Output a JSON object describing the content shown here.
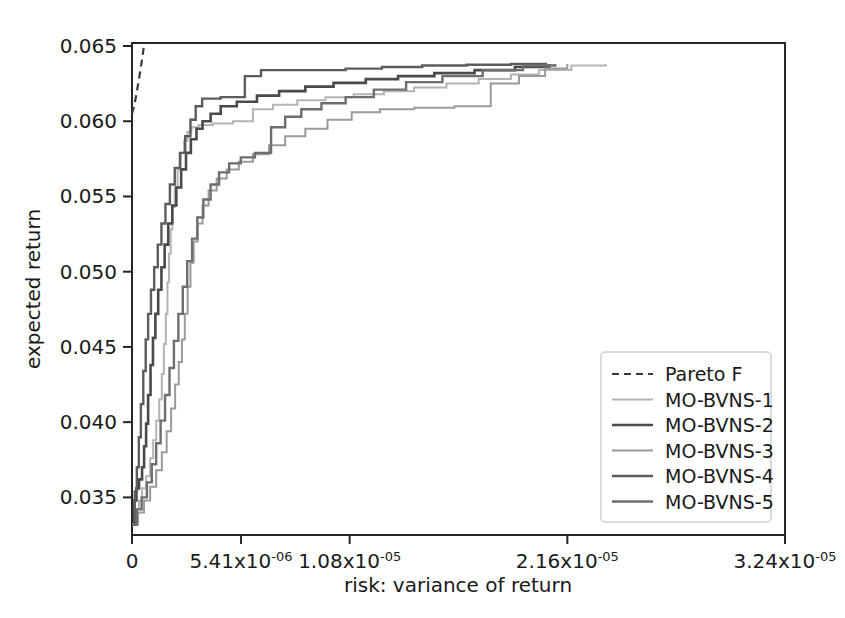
{
  "chart_data": {
    "type": "line",
    "title": "",
    "xlabel": "risk: variance of return",
    "ylabel": "expected return",
    "grid": false,
    "legend_position": "lower-right",
    "xlim": [
      0,
      3.24e-05
    ],
    "ylim": [
      0.0325,
      0.0652
    ],
    "xticks": [
      0,
      5.41e-06,
      1.08e-05,
      2.16e-05,
      3.24e-05
    ],
    "xtick_labels": [
      {
        "mantissa": "0",
        "exp": ""
      },
      {
        "mantissa": "5.41x10",
        "exp": "-06"
      },
      {
        "mantissa": "1.08x10",
        "exp": "-05"
      },
      {
        "mantissa": "2.16x10",
        "exp": "-05"
      },
      {
        "mantissa": "3.24x10",
        "exp": "-05"
      }
    ],
    "yticks": [
      0.035,
      0.04,
      0.045,
      0.05,
      0.055,
      0.06,
      0.065
    ],
    "ytick_labels": [
      "0.035",
      "0.040",
      "0.045",
      "0.050",
      "0.055",
      "0.060",
      "0.065"
    ],
    "series": [
      {
        "name": "Pareto F",
        "color": "#3a3a3a",
        "width": 2.2,
        "dash": "7,5",
        "points": [
          [
            0.0,
            0.0605
          ],
          [
            1.2e-07,
            0.0611
          ],
          [
            2.2e-07,
            0.0618
          ],
          [
            3.2e-07,
            0.0626
          ],
          [
            4.2e-07,
            0.0634
          ],
          [
            5.2e-07,
            0.0643
          ],
          [
            6e-07,
            0.0651
          ]
        ]
      },
      {
        "name": "MO-BVNS-1",
        "color": "#b4b4b4",
        "width": 2.0,
        "dash": "",
        "points": [
          [
            0.0,
            0.0332
          ],
          [
            2e-07,
            0.0342
          ],
          [
            3.5e-07,
            0.0348
          ],
          [
            5e-07,
            0.0356
          ],
          [
            7e-07,
            0.0364
          ],
          [
            9e-07,
            0.0376
          ],
          [
            1.05e-06,
            0.0388
          ],
          [
            1.2e-06,
            0.0401
          ],
          [
            1.35e-06,
            0.0415
          ],
          [
            1.48e-06,
            0.0432
          ],
          [
            1.58e-06,
            0.0452
          ],
          [
            1.68e-06,
            0.0472
          ],
          [
            1.76e-06,
            0.0493
          ],
          [
            1.84e-06,
            0.0512
          ],
          [
            1.92e-06,
            0.0528
          ],
          [
            2e-06,
            0.0543
          ],
          [
            2.12e-06,
            0.0556
          ],
          [
            2.26e-06,
            0.0568
          ],
          [
            2.42e-06,
            0.0579
          ],
          [
            2.58e-06,
            0.0587
          ],
          [
            2.75e-06,
            0.0593
          ],
          [
            2.95e-06,
            0.0596
          ],
          [
            3.3e-06,
            0.05975
          ],
          [
            4e-06,
            0.05985
          ],
          [
            5e-06,
            0.06
          ],
          [
            6e-06,
            0.0608
          ],
          [
            7e-06,
            0.0611
          ],
          [
            8.2e-06,
            0.0614
          ],
          [
            9.6e-06,
            0.0616
          ],
          [
            1.1e-05,
            0.0618
          ],
          [
            1.25e-05,
            0.062
          ],
          [
            1.4e-05,
            0.06225
          ],
          [
            1.56e-05,
            0.0625
          ],
          [
            1.72e-05,
            0.0628
          ],
          [
            1.88e-05,
            0.0631
          ],
          [
            2.02e-05,
            0.0634
          ],
          [
            2.18e-05,
            0.0637
          ],
          [
            2.35e-05,
            0.0638
          ]
        ]
      },
      {
        "name": "MO-BVNS-2",
        "color": "#4a4a4a",
        "width": 2.6,
        "dash": "",
        "points": [
          [
            0.0,
            0.0332
          ],
          [
            1.2e-07,
            0.0348
          ],
          [
            2.2e-07,
            0.0356
          ],
          [
            3.5e-07,
            0.0362
          ],
          [
            5e-07,
            0.037
          ],
          [
            6e-07,
            0.0384
          ],
          [
            7e-07,
            0.0399
          ],
          [
            8e-07,
            0.0418
          ],
          [
            9.2e-07,
            0.0438
          ],
          [
            1.04e-06,
            0.0456
          ],
          [
            1.16e-06,
            0.0472
          ],
          [
            1.3e-06,
            0.0488
          ],
          [
            1.46e-06,
            0.0503
          ],
          [
            1.62e-06,
            0.0518
          ],
          [
            1.8e-06,
            0.0532
          ],
          [
            2e-06,
            0.0544
          ],
          [
            2.2e-06,
            0.0556
          ],
          [
            2.44e-06,
            0.0568
          ],
          [
            2.68e-06,
            0.0579
          ],
          [
            2.92e-06,
            0.0588
          ],
          [
            3.2e-06,
            0.0595
          ],
          [
            3.5e-06,
            0.06
          ],
          [
            3.9e-06,
            0.0605
          ],
          [
            4.4e-06,
            0.061
          ],
          [
            5.2e-06,
            0.0613
          ],
          [
            6.2e-06,
            0.0617
          ],
          [
            7.3e-06,
            0.062
          ],
          [
            8.6e-06,
            0.0623
          ],
          [
            1e-05,
            0.06255
          ],
          [
            1.16e-05,
            0.0628
          ],
          [
            1.32e-05,
            0.063
          ],
          [
            1.5e-05,
            0.0632
          ],
          [
            1.7e-05,
            0.0634
          ],
          [
            1.9e-05,
            0.0636
          ],
          [
            2.07e-05,
            0.0638
          ]
        ]
      },
      {
        "name": "MO-BVNS-3",
        "color": "#9a9a9a",
        "width": 2.0,
        "dash": "",
        "points": [
          [
            0.0,
            0.0332
          ],
          [
            3e-07,
            0.034
          ],
          [
            6e-07,
            0.0348
          ],
          [
            9e-07,
            0.0357
          ],
          [
            1.2e-06,
            0.0368
          ],
          [
            1.48e-06,
            0.038
          ],
          [
            1.72e-06,
            0.0394
          ],
          [
            1.94e-06,
            0.0409
          ],
          [
            2.14e-06,
            0.0425
          ],
          [
            2.32e-06,
            0.044
          ],
          [
            2.48e-06,
            0.0455
          ],
          [
            2.62e-06,
            0.0472
          ],
          [
            2.76e-06,
            0.049
          ],
          [
            2.9e-06,
            0.0506
          ],
          [
            3.06e-06,
            0.052
          ],
          [
            3.26e-06,
            0.0532
          ],
          [
            3.5e-06,
            0.0544
          ],
          [
            3.8e-06,
            0.0554
          ],
          [
            4.2e-06,
            0.0562
          ],
          [
            4.7e-06,
            0.0568
          ],
          [
            5.3e-06,
            0.0573
          ],
          [
            6e-06,
            0.0578
          ],
          [
            6.8e-06,
            0.0584
          ],
          [
            7.6e-06,
            0.059
          ],
          [
            8.6e-06,
            0.0595
          ],
          [
            9.7e-06,
            0.0601
          ],
          [
            1.09e-05,
            0.0606
          ],
          [
            1.23e-05,
            0.0608
          ],
          [
            1.4e-05,
            0.0609
          ],
          [
            1.6e-05,
            0.061
          ],
          [
            1.78e-05,
            0.0625
          ],
          [
            1.92e-05,
            0.063
          ],
          [
            2.05e-05,
            0.0635
          ],
          [
            2.16e-05,
            0.0638
          ]
        ]
      },
      {
        "name": "MO-BVNS-4",
        "color": "#5c5c5c",
        "width": 2.4,
        "dash": "",
        "points": [
          [
            0.0,
            0.0332
          ],
          [
            1.4e-07,
            0.0354
          ],
          [
            2.4e-07,
            0.037
          ],
          [
            3.4e-07,
            0.039
          ],
          [
            4.4e-07,
            0.0412
          ],
          [
            5.6e-07,
            0.0434
          ],
          [
            6.8e-07,
            0.0455
          ],
          [
            8e-07,
            0.0472
          ],
          [
            9.4e-07,
            0.0488
          ],
          [
            1.1e-06,
            0.0503
          ],
          [
            1.28e-06,
            0.0518
          ],
          [
            1.46e-06,
            0.0532
          ],
          [
            1.66e-06,
            0.0545
          ],
          [
            1.88e-06,
            0.0558
          ],
          [
            2.12e-06,
            0.0569
          ],
          [
            2.38e-06,
            0.0579
          ],
          [
            2.64e-06,
            0.059
          ],
          [
            2.9e-06,
            0.0601
          ],
          [
            3.16e-06,
            0.061
          ],
          [
            3.48e-06,
            0.0615
          ],
          [
            3.9e-06,
            0.0615
          ],
          [
            4.4e-06,
            0.0616
          ],
          [
            5.2e-06,
            0.0616
          ],
          [
            5.6e-06,
            0.063
          ],
          [
            6.4e-06,
            0.0634
          ],
          [
            7.6e-06,
            0.0634
          ],
          [
            9e-06,
            0.0634
          ],
          [
            1.06e-05,
            0.0635
          ],
          [
            1.24e-05,
            0.0636
          ],
          [
            1.44e-05,
            0.0637
          ],
          [
            1.66e-05,
            0.06375
          ],
          [
            1.88e-05,
            0.0638
          ],
          [
            2.06e-05,
            0.0638
          ]
        ]
      },
      {
        "name": "MO-BVNS-5",
        "color": "#6e6e6e",
        "width": 2.4,
        "dash": "",
        "points": [
          [
            0.0,
            0.0332
          ],
          [
            2.4e-07,
            0.0342
          ],
          [
            4.8e-07,
            0.035
          ],
          [
            7.4e-07,
            0.036
          ],
          [
            9.8e-07,
            0.0372
          ],
          [
            1.2e-06,
            0.0386
          ],
          [
            1.42e-06,
            0.0401
          ],
          [
            1.64e-06,
            0.0418
          ],
          [
            1.86e-06,
            0.0436
          ],
          [
            2.08e-06,
            0.0454
          ],
          [
            2.3e-06,
            0.0472
          ],
          [
            2.52e-06,
            0.049
          ],
          [
            2.74e-06,
            0.0507
          ],
          [
            2.98e-06,
            0.0522
          ],
          [
            3.24e-06,
            0.0536
          ],
          [
            3.54e-06,
            0.0548
          ],
          [
            3.9e-06,
            0.0558
          ],
          [
            4.32e-06,
            0.0566
          ],
          [
            4.82e-06,
            0.0572
          ],
          [
            5.4e-06,
            0.0576
          ],
          [
            6.1e-06,
            0.0579
          ],
          [
            6.9e-06,
            0.0596
          ],
          [
            7.6e-06,
            0.0603
          ],
          [
            8.4e-06,
            0.0608
          ],
          [
            9.4e-06,
            0.0612
          ],
          [
            1.06e-05,
            0.0616
          ],
          [
            1.2e-05,
            0.0621
          ],
          [
            1.36e-05,
            0.0626
          ],
          [
            1.54e-05,
            0.063
          ],
          [
            1.74e-05,
            0.0634
          ],
          [
            1.94e-05,
            0.0637
          ],
          [
            2.1e-05,
            0.0638
          ]
        ]
      }
    ]
  },
  "legend": {
    "entries": [
      {
        "label": "Pareto F"
      },
      {
        "label": "MO-BVNS-1"
      },
      {
        "label": "MO-BVNS-2"
      },
      {
        "label": "MO-BVNS-3"
      },
      {
        "label": "MO-BVNS-4"
      },
      {
        "label": "MO-BVNS-5"
      }
    ]
  }
}
